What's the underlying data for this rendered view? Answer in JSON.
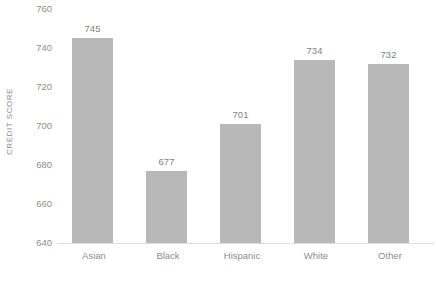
{
  "chart_data": {
    "type": "bar",
    "title": "",
    "subtitle": "",
    "xlabel": "",
    "ylabel": "CREDIT SCORE",
    "categories": [
      "Asian",
      "Black",
      "Hispanic",
      "White",
      "Other"
    ],
    "values": [
      745,
      677,
      701,
      734,
      732
    ],
    "data_labels": [
      "745",
      "677",
      "701",
      "734",
      "732"
    ],
    "ylim": [
      640,
      760
    ],
    "yticks": [
      640,
      660,
      680,
      700,
      720,
      740,
      760
    ],
    "ytick_labels": [
      "640",
      "660",
      "680",
      "700",
      "720",
      "740",
      "760"
    ],
    "grid": false,
    "legend": null,
    "legend_position": "none",
    "series": [
      {
        "name": "Credit score",
        "values": [
          745,
          677,
          701,
          734,
          732
        ]
      }
    ],
    "colors": {
      "bar_fill": "#b8b8b8",
      "axis_line": "#dddddd",
      "tick_label": "#8d8d8d",
      "data_label": "#7f7f7f",
      "background": "#ffffff"
    }
  }
}
